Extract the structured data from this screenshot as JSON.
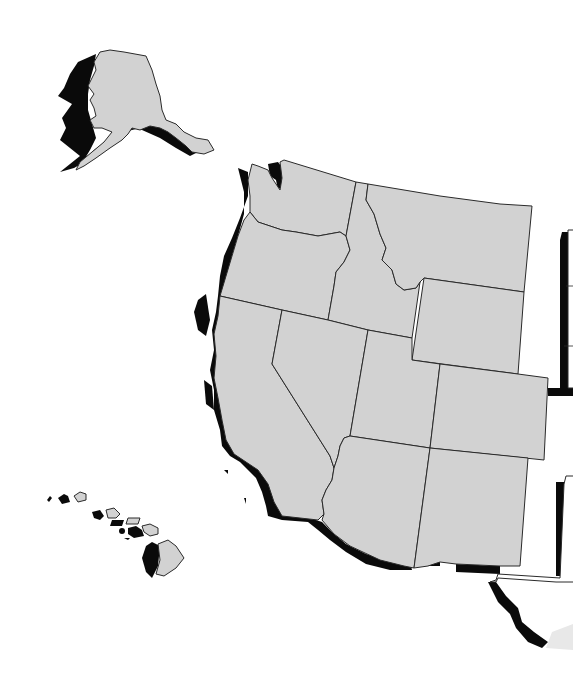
{
  "map": {
    "title": "",
    "region": "Western United States",
    "style": "flat gray states with black drop shadow to the southwest",
    "colors": {
      "land": "#d2d2d2",
      "border": "#2a2a2a",
      "shadow": "#0a0a0a",
      "background": "#ffffff"
    },
    "states": [
      {
        "id": "AK",
        "name": "Alaska",
        "inset": true
      },
      {
        "id": "HI",
        "name": "Hawaii",
        "inset": true
      },
      {
        "id": "WA",
        "name": "Washington"
      },
      {
        "id": "OR",
        "name": "Oregon"
      },
      {
        "id": "CA",
        "name": "California"
      },
      {
        "id": "ID",
        "name": "Idaho"
      },
      {
        "id": "NV",
        "name": "Nevada"
      },
      {
        "id": "MT",
        "name": "Montana"
      },
      {
        "id": "WY",
        "name": "Wyoming"
      },
      {
        "id": "UT",
        "name": "Utah"
      },
      {
        "id": "CO",
        "name": "Colorado"
      },
      {
        "id": "AZ",
        "name": "Arizona"
      },
      {
        "id": "NM",
        "name": "New Mexico"
      }
    ],
    "partial_neighbors": [
      "North Dakota / South Dakota / Nebraska edge (white, cut off)",
      "Texas edge (white, cut off)",
      "Mexico coastline shadow (Baja)"
    ]
  }
}
